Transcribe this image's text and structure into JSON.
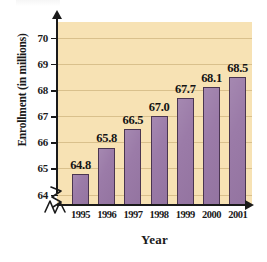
{
  "chart_data": {
    "type": "bar",
    "title": "",
    "xlabel": "Year",
    "ylabel": "Enrollment (in millions)",
    "categories": [
      "1995",
      "1996",
      "1997",
      "1998",
      "1999",
      "2000",
      "2001"
    ],
    "values": [
      64.8,
      65.8,
      66.5,
      67.0,
      67.7,
      68.1,
      68.5
    ],
    "data_labels": [
      "64.8",
      "65.8",
      "66.5",
      "67.0",
      "67.7",
      "68.1",
      "68.5"
    ],
    "ytick_labels": [
      "70",
      "69",
      "68",
      "67",
      "66",
      "65",
      "64"
    ],
    "ytick_values": [
      70,
      69,
      68,
      67,
      66,
      65,
      64
    ],
    "ylim": [
      63.6,
      70.6
    ],
    "y_axis_broken": true,
    "x_axis_broken": true,
    "grid": "horizontal",
    "legend": "none",
    "colors": {
      "bar_fill": "#9b7ba8",
      "bar_edge": "#4a3550",
      "plot_background": "#f7e2b4",
      "gridline": "#d9c08c",
      "axis": "#1a1a1a",
      "page_background": "#ffffff"
    }
  }
}
